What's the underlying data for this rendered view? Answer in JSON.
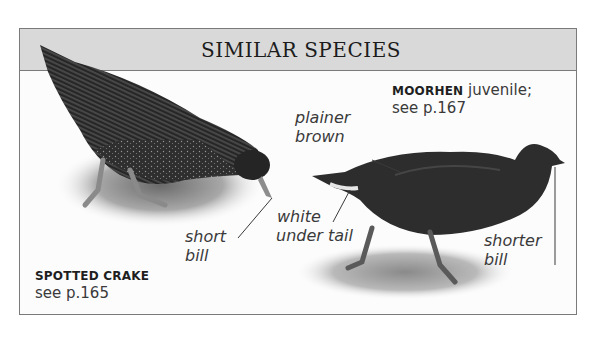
{
  "panel": {
    "title": "SIMILAR SPECIES",
    "header_bg": "#d9d9d9",
    "border_color": "#7a7a7a"
  },
  "species": [
    {
      "name": "SPOTTED CRAKE",
      "qualifier": "",
      "reference": "see p.165",
      "annotations": [
        {
          "line1": "short",
          "line2": "bill"
        }
      ]
    },
    {
      "name": "MOORHEN",
      "qualifier": " juvenile;",
      "reference": "see p.167",
      "annotations": [
        {
          "line1": "plainer",
          "line2": "brown"
        },
        {
          "line1": "white",
          "line2": "under tail"
        },
        {
          "line1": "shorter",
          "line2": "bill"
        }
      ]
    }
  ]
}
